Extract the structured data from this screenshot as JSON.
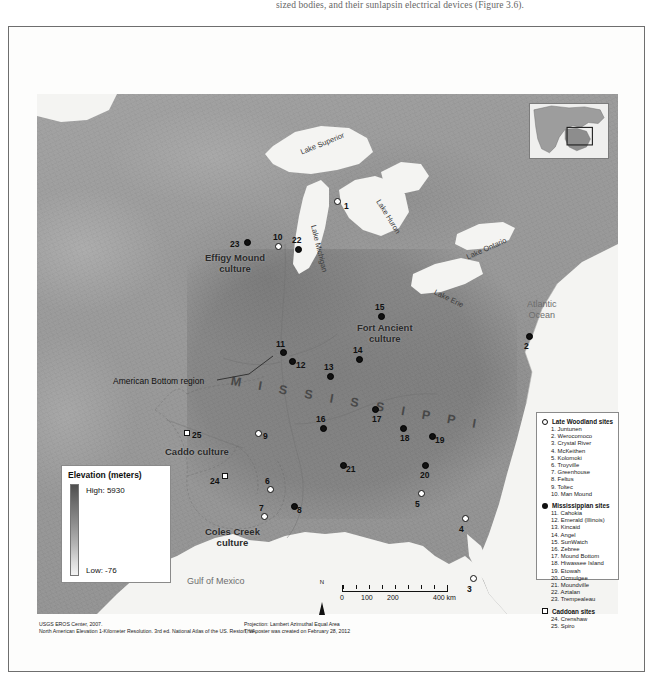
{
  "page": {
    "top_paragraph": "sized bodies, and their sunlapsin electrical devices (Figure 3.6)."
  },
  "map": {
    "region_labels": [
      {
        "name": "effigy-mound-culture",
        "text": "Effigy Mound\nculture",
        "x": 200,
        "y": 160
      },
      {
        "name": "fort-ancient-culture",
        "text": "Fort Ancient\nculture",
        "x": 318,
        "y": 232
      },
      {
        "name": "caddo-culture",
        "text": "Caddo culture",
        "x": 128,
        "y": 355
      },
      {
        "name": "coles-creek-culture",
        "text": "Coles Creek\nculture",
        "x": 171,
        "y": 435
      }
    ],
    "american_bottom_label": "American Bottom region",
    "river_label": "M I S S I S S I P P I",
    "lake_labels": [
      {
        "name": "lake-superior",
        "text": "Lake Superior",
        "x": 262,
        "y": 45,
        "rot": -22
      },
      {
        "name": "lake-michigan",
        "text": "Lake Michigan",
        "x": 268,
        "y": 150,
        "rot": 76
      },
      {
        "name": "lake-huron",
        "text": "Lake Huron",
        "x": 352,
        "y": 120,
        "rot": 58
      },
      {
        "name": "lake-erie",
        "text": "Lake Erie",
        "x": 398,
        "y": 201,
        "rot": 26
      },
      {
        "name": "lake-ontario",
        "text": "Lake Ontario",
        "x": 432,
        "y": 155,
        "rot": -24
      }
    ],
    "ocean_labels": [
      {
        "name": "atlantic-ocean",
        "text": "Atlantic\nOcean",
        "x": 497,
        "y": 212
      },
      {
        "name": "gulf-of-mexico",
        "text": "Gulf of Mexico",
        "x": 188,
        "y": 486
      }
    ],
    "sites": [
      {
        "num": "1",
        "type": "lw",
        "x": 297,
        "y": 104,
        "lx": 10,
        "ly": 3
      },
      {
        "num": "2",
        "type": "miss",
        "x": 489,
        "y": 239,
        "lx": -2,
        "ly": 8
      },
      {
        "num": "3",
        "type": "lw",
        "x": 433,
        "y": 481,
        "lx": -3,
        "ly": 9
      },
      {
        "num": "4",
        "type": "lw",
        "x": 425,
        "y": 421,
        "lx": -3,
        "ly": 9
      },
      {
        "num": "5",
        "type": "lw",
        "x": 381,
        "y": 396,
        "lx": -3,
        "ly": 9
      },
      {
        "num": "6",
        "type": "lw",
        "x": 230,
        "y": 392,
        "lx": -2,
        "ly": -10
      },
      {
        "num": "7",
        "type": "lw",
        "x": 224,
        "y": 419,
        "lx": -2,
        "ly": -10
      },
      {
        "num": "8",
        "type": "miss",
        "x": 254,
        "y": 409,
        "lx": 6,
        "ly": 2
      },
      {
        "num": "9",
        "type": "lw",
        "x": 218,
        "y": 336,
        "lx": 8,
        "ly": 1
      },
      {
        "num": "10",
        "type": "lw",
        "x": 238,
        "y": 149,
        "lx": -2,
        "ly": -11
      },
      {
        "num": "11",
        "type": "miss",
        "x": 243,
        "y": 255,
        "lx": -4,
        "ly": -10
      },
      {
        "num": "12",
        "type": "miss",
        "x": 252,
        "y": 264,
        "lx": 7,
        "ly": 2
      },
      {
        "num": "13",
        "type": "miss",
        "x": 290,
        "y": 279,
        "lx": -3,
        "ly": -11
      },
      {
        "num": "14",
        "type": "miss",
        "x": 319,
        "y": 262,
        "lx": -3,
        "ly": -11
      },
      {
        "num": "15",
        "type": "miss",
        "x": 341,
        "y": 219,
        "lx": -3,
        "ly": -11
      },
      {
        "num": "16",
        "type": "miss",
        "x": 283,
        "y": 331,
        "lx": -4,
        "ly": -11
      },
      {
        "num": "17",
        "type": "miss",
        "x": 335,
        "y": 312,
        "lx": 0,
        "ly": 8
      },
      {
        "num": "18",
        "type": "miss",
        "x": 363,
        "y": 331,
        "lx": 0,
        "ly": 8
      },
      {
        "num": "19",
        "type": "miss",
        "x": 392,
        "y": 339,
        "lx": 6,
        "ly": 2
      },
      {
        "num": "20",
        "type": "miss",
        "x": 385,
        "y": 368,
        "lx": -2,
        "ly": 8
      },
      {
        "num": "21",
        "type": "miss",
        "x": 303,
        "y": 368,
        "lx": 6,
        "ly": 2
      },
      {
        "num": "22",
        "type": "miss",
        "x": 258,
        "y": 152,
        "lx": -3,
        "ly": -11
      },
      {
        "num": "23",
        "type": "miss",
        "x": 207,
        "y": 145,
        "lx": -14,
        "ly": 0
      },
      {
        "num": "24",
        "type": "cad",
        "x": 185,
        "y": 379,
        "lx": -12,
        "ly": 3
      },
      {
        "num": "25",
        "type": "cad",
        "x": 147,
        "y": 336,
        "lx": 8,
        "ly": 0
      }
    ]
  },
  "elevation_legend": {
    "title": "Elevation (meters)",
    "high": "High: 5930",
    "low": "Low: -76"
  },
  "site_legend": {
    "groups": [
      {
        "symbol": "lw",
        "title": "Late Woodland sites",
        "items": [
          "1. Juntunen",
          "2. Werocomoco",
          "3. Crystal River",
          "4. McKeithen",
          "5. Kolomoki",
          "6. Troyville",
          "7. Greenhouse",
          "8. Feltus",
          "9. Toltec",
          "10. Man Mound"
        ]
      },
      {
        "symbol": "miss",
        "title": "Mississippian sites",
        "items": [
          "11. Cahokia",
          "12. Emerald (Illinois)",
          "13. Kincaid",
          "14. Angel",
          "15. SunWatch",
          "16. Zebree",
          "17. Mound Bottom",
          "18. Hiwassee Island",
          "19. Etowah",
          "20. Ocmulgee",
          "21. Moundville",
          "22. Aztalan",
          "23. Trempealeau"
        ]
      },
      {
        "symbol": "cad",
        "title": "Caddoan sites",
        "items": [
          "24. Crenshaw",
          "25. Spiro"
        ]
      }
    ]
  },
  "scale_bar": {
    "north": "N",
    "ticks": [
      "0",
      "100",
      "200",
      "400 km"
    ]
  },
  "credits": {
    "left_line1": "USGS EROS Center, 2007.",
    "left_line2": "North American Elevation 1-Kilometer Resolution. 3rd ed. National Atlas of the US. Reston, VA.",
    "right_line1": "Projection: Lambert Azimuthal Equal Area",
    "right_line2": "This poster was created on February 28, 2012"
  }
}
